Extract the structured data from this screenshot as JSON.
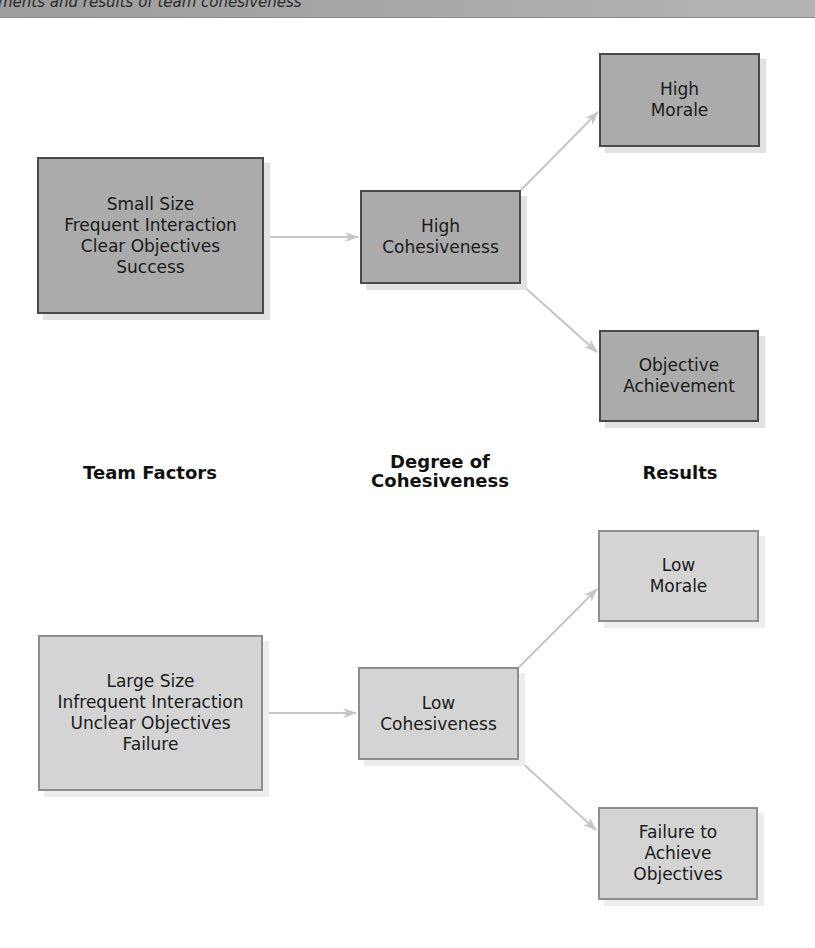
{
  "header": {
    "caption": "ments and results of team cohesiveness"
  },
  "column_labels": {
    "team_factors": "Team Factors",
    "degree_line1": "Degree of",
    "degree_line2": "Cohesiveness",
    "results": "Results"
  },
  "high_path": {
    "factors": [
      "Small Size",
      "Frequent Interaction",
      "Clear Objectives",
      "Success"
    ],
    "cohesiveness": [
      "High",
      "Cohesiveness"
    ],
    "result_top": [
      "High",
      "Morale"
    ],
    "result_bottom": [
      "Objective",
      "Achievement"
    ]
  },
  "low_path": {
    "factors": [
      "Large Size",
      "Infrequent Interaction",
      "Unclear Objectives",
      "Failure"
    ],
    "cohesiveness": [
      "Low",
      "Cohesiveness"
    ],
    "result_top": [
      "Low",
      "Morale"
    ],
    "result_bottom": [
      "Failure to",
      "Achieve",
      "Objectives"
    ]
  },
  "colors": {
    "high_box_fill": "#ababab",
    "high_box_border": "#4a4a4a",
    "low_box_fill": "#d4d4d4",
    "low_box_border": "#8e8e8e",
    "arrow": "#c6c6c6"
  }
}
